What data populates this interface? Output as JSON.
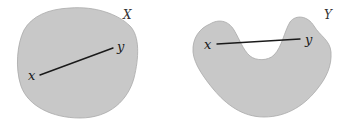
{
  "figure": {
    "panels": [
      {
        "name": "convex-set",
        "set_label": "X",
        "point_a_label": "x",
        "point_b_label": "y",
        "fill_color": "#c8c8c8"
      },
      {
        "name": "nonconvex-set",
        "set_label": "Y",
        "point_a_label": "x",
        "point_b_label": "y",
        "fill_color": "#c8c8c8"
      }
    ]
  }
}
